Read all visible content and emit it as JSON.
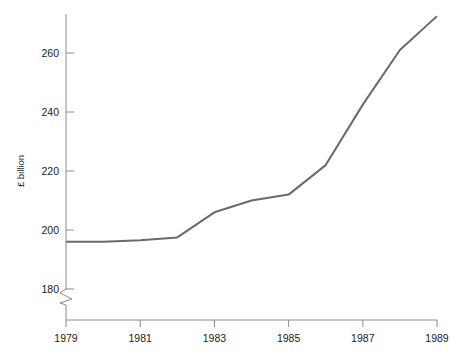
{
  "chart_data": {
    "type": "line",
    "title": "",
    "subtitle": "",
    "xlabel": "",
    "ylabel": "£ billion",
    "x": [
      1979,
      1980,
      1981,
      1982,
      1983,
      1984,
      1985,
      1986,
      1987,
      1988,
      1989
    ],
    "xtick_labels": [
      "1979",
      "1981",
      "1983",
      "1985",
      "1987",
      "1989"
    ],
    "xticks": [
      1979,
      1981,
      1983,
      1985,
      1987,
      1989
    ],
    "xlim": [
      1979,
      1989
    ],
    "ytick_labels": [
      "180",
      "200",
      "220",
      "240",
      "260"
    ],
    "yticks": [
      180,
      200,
      220,
      240,
      260
    ],
    "ylim": [
      180,
      275
    ],
    "y_axis_break": true,
    "grid": false,
    "legend_position": "none",
    "series": [
      {
        "name": "",
        "color": "#6a6a6a",
        "values": [
          196,
          196,
          196.5,
          197.5,
          206,
          210,
          212,
          222,
          242.5,
          261,
          272.5
        ]
      }
    ]
  },
  "axis_styles": {
    "axis_color": "#8a8a8a",
    "text_color": "#1a1a1a",
    "background": "#ffffff"
  },
  "icons": {
    "axis_break": "axis-break-zigzag"
  }
}
